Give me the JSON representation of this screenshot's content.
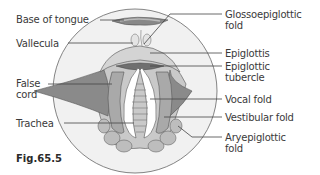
{
  "figure": {
    "caption": "Fig.65.5",
    "labels_left": [
      {
        "id": "base-of-tongue",
        "text": "Base of tongue"
      },
      {
        "id": "vallecula",
        "text": "Vallecula"
      },
      {
        "id": "false-cord",
        "text": "False\ncord",
        "lines": [
          "False",
          "cord"
        ]
      },
      {
        "id": "trachea",
        "text": "Trachea"
      }
    ],
    "labels_right": [
      {
        "id": "glossoepiglottic-fold",
        "lines": [
          "Glossoepiglottic",
          "fold"
        ]
      },
      {
        "id": "epiglottis",
        "lines": [
          "Epiglottis"
        ]
      },
      {
        "id": "epiglottic-tubercle",
        "lines": [
          "Epiglottic",
          "tubercle"
        ]
      },
      {
        "id": "vocal-fold",
        "lines": [
          "Vocal fold"
        ]
      },
      {
        "id": "vestibular-fold",
        "lines": [
          "Vestibular fold"
        ]
      },
      {
        "id": "aryepiglottic-fold",
        "lines": [
          "Aryepiglottic",
          "fold"
        ]
      }
    ]
  },
  "colors": {
    "outline": "#555555",
    "light_fill": "#e6e6e6",
    "mid_fill": "#b8b8b8",
    "dark_fill": "#7a7a7a",
    "white": "#ffffff",
    "text": "#3a3a3a"
  }
}
